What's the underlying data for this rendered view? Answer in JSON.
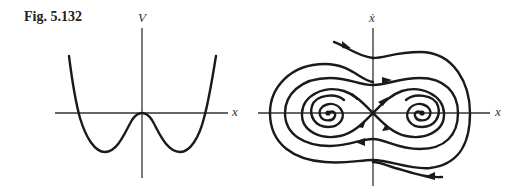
{
  "figure": {
    "label": "Fig. 5.132",
    "left_panel": {
      "title": "Potential energy curve",
      "y_axis_label": "V",
      "x_axis_label": "x",
      "curve": "double-well potential with local maximum at origin and two symmetric minima"
    },
    "right_panel": {
      "title": "Phase portrait",
      "y_axis_label": "ẋ",
      "x_axis_label": "x",
      "features": [
        "saddle point at origin",
        "two stable spiral foci at potential minima",
        "trajectories spiralling inward",
        "separatrices through saddle"
      ]
    }
  },
  "colors": {
    "ink": "#1a1a1a",
    "axis": "#333333",
    "background": "#ffffff"
  }
}
